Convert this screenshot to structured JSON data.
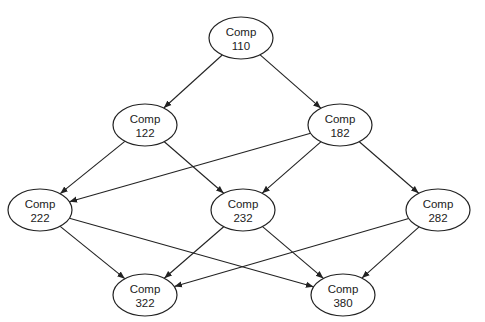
{
  "diagram": {
    "type": "directed-graph",
    "nodes": [
      {
        "id": "110",
        "line1": "Comp",
        "line2": "110",
        "cx": 241,
        "cy": 38
      },
      {
        "id": "122",
        "line1": "Comp",
        "line2": "122",
        "cx": 145,
        "cy": 125
      },
      {
        "id": "182",
        "line1": "Comp",
        "line2": "182",
        "cx": 340,
        "cy": 125
      },
      {
        "id": "222",
        "line1": "Comp",
        "line2": "222",
        "cx": 40,
        "cy": 210
      },
      {
        "id": "232",
        "line1": "Comp",
        "line2": "232",
        "cx": 243,
        "cy": 210
      },
      {
        "id": "282",
        "line1": "Comp",
        "line2": "282",
        "cx": 438,
        "cy": 210
      },
      {
        "id": "322",
        "line1": "Comp",
        "line2": "322",
        "cx": 145,
        "cy": 295
      },
      {
        "id": "380",
        "line1": "Comp",
        "line2": "380",
        "cx": 343,
        "cy": 295
      }
    ],
    "edges": [
      {
        "from": "110",
        "to": "122"
      },
      {
        "from": "110",
        "to": "182"
      },
      {
        "from": "122",
        "to": "222"
      },
      {
        "from": "122",
        "to": "232"
      },
      {
        "from": "182",
        "to": "222"
      },
      {
        "from": "182",
        "to": "232"
      },
      {
        "from": "182",
        "to": "282"
      },
      {
        "from": "222",
        "to": "322"
      },
      {
        "from": "222",
        "to": "380"
      },
      {
        "from": "232",
        "to": "322"
      },
      {
        "from": "232",
        "to": "380"
      },
      {
        "from": "282",
        "to": "322"
      },
      {
        "from": "282",
        "to": "380"
      }
    ],
    "colors": {
      "stroke": "#222222",
      "fill": "#ffffff"
    }
  }
}
